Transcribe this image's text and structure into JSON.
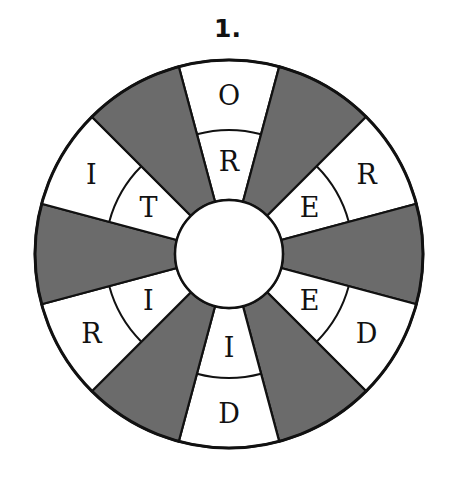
{
  "puzzle": {
    "number_label": "1.",
    "colors": {
      "shaded": "#6b6b6b",
      "blank": "#ffffff",
      "stroke": "#111111"
    },
    "geometry": {
      "center": [
        229,
        254
      ],
      "outer_radius": 194,
      "middle_radius": 124,
      "inner_radius": 54,
      "sector_count": 12,
      "sector_degrees": 30
    },
    "sectors": [
      {
        "angle": 0,
        "shaded": false,
        "outer": "O",
        "middle": "R"
      },
      {
        "angle": 30,
        "shaded": true
      },
      {
        "angle": 60,
        "shaded": false,
        "outer": "R",
        "middle": "E"
      },
      {
        "angle": 90,
        "shaded": true
      },
      {
        "angle": 120,
        "shaded": false,
        "outer": "D",
        "middle": "E"
      },
      {
        "angle": 150,
        "shaded": true
      },
      {
        "angle": 180,
        "shaded": false,
        "outer": "D",
        "middle": "I"
      },
      {
        "angle": 210,
        "shaded": true
      },
      {
        "angle": 240,
        "shaded": false,
        "outer": "R",
        "middle": "I"
      },
      {
        "angle": 270,
        "shaded": true
      },
      {
        "angle": 300,
        "shaded": false,
        "outer": "I",
        "middle": "T"
      },
      {
        "angle": 330,
        "shaded": true
      }
    ]
  }
}
